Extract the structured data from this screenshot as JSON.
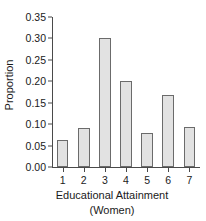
{
  "chart_data": {
    "type": "bar",
    "title": "",
    "xlabel": "Educational Attainment",
    "xlabel_line2": "(Women)",
    "ylabel": "Proportion",
    "categories": [
      "1",
      "2",
      "3",
      "4",
      "5",
      "6",
      "7"
    ],
    "values": [
      0.063,
      0.091,
      0.302,
      0.2,
      0.079,
      0.168,
      0.093
    ],
    "ylim": [
      0.0,
      0.35
    ],
    "ytick_labels": [
      "0.00",
      "0.05",
      "0.10",
      "0.15",
      "0.20",
      "0.25",
      "0.30",
      "0.35"
    ],
    "ytick_values": [
      0.0,
      0.05,
      0.1,
      0.15,
      0.2,
      0.25,
      0.3,
      0.35
    ],
    "grid": false,
    "legend": "none",
    "bar_fill_color": "#e2e2e2",
    "bar_border_color": "#6b6b6b",
    "axis_color": "#4a4a4a",
    "text_color": "#1a1a1a",
    "background_color": "#ffffff"
  }
}
